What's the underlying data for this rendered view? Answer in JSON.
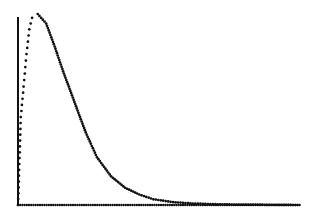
{
  "chart_data": {
    "type": "scatter",
    "title": "",
    "xlabel": "",
    "ylabel": "",
    "grid": false,
    "legend": null,
    "xlim": [
      0,
      1
    ],
    "ylim": [
      0,
      1
    ],
    "series": [
      {
        "name": "density",
        "x": [
          0.0,
          0.01,
          0.02,
          0.03,
          0.04,
          0.05,
          0.07,
          0.1,
          0.13,
          0.16,
          0.2,
          0.24,
          0.28,
          0.33,
          0.38,
          0.43,
          0.48,
          0.55,
          0.62,
          0.7,
          0.8,
          0.9,
          1.0
        ],
        "y": [
          0.0,
          0.46,
          0.62,
          0.79,
          0.92,
          0.98,
          1.0,
          0.95,
          0.83,
          0.7,
          0.54,
          0.38,
          0.25,
          0.15,
          0.09,
          0.055,
          0.03,
          0.015,
          0.008,
          0.004,
          0.002,
          0.001,
          0.0
        ]
      }
    ],
    "axes": {
      "y_axis_visible": true,
      "x_axis_style": "dotted",
      "tick_labels": []
    }
  },
  "style": {
    "dot_color": "#111111",
    "axis_color": "#111111",
    "background": "#ffffff"
  }
}
